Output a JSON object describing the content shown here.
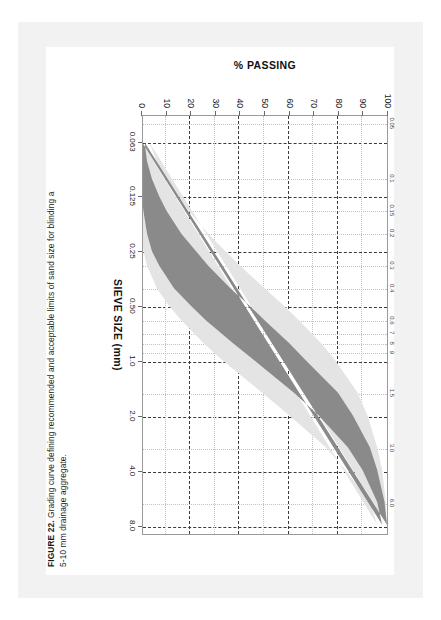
{
  "caption": {
    "figure_label": "FIGURE 22.",
    "line1": " Grading curve defining recommended and acceptable limits of sand size for blinding a",
    "line2": "5-10 mm drainage aggregate."
  },
  "colors": {
    "recommended_band": "#8a8a8a",
    "acceptable_band": "#e4e4e4",
    "grid_major": "#3a3a3a",
    "grid_minor": "#c2c2c2",
    "page_background": "#f2f2f2",
    "plot_background": "#ffffff",
    "frame": "#9a9a9a"
  },
  "chart_data": {
    "type": "area",
    "title": "",
    "xlabel": "SIEVE SIZE (mm)",
    "ylabel": "% PASSING",
    "xscale": "log",
    "xlim": [
      0.045,
      9.0
    ],
    "ylim": [
      0,
      100
    ],
    "grid": true,
    "legend": "none",
    "x_major_ticks": [
      "0.063",
      "0.125",
      "0.25",
      "0.50",
      "1.0",
      "2.0",
      "4.0",
      "8.0"
    ],
    "x_major_values": [
      0.063,
      0.125,
      0.25,
      0.5,
      1.0,
      2.0,
      4.0,
      8.0
    ],
    "x_secondary_ticks": [
      "0.05",
      "0.1",
      "0.15",
      "0.2",
      "0.3",
      "0.4",
      "0.6",
      "7",
      "8",
      "9",
      "1.5",
      "3.0",
      "6.0"
    ],
    "x_secondary_values": [
      0.05,
      0.1,
      0.15,
      0.2,
      0.3,
      0.4,
      0.6,
      0.7,
      0.8,
      0.9,
      1.5,
      3.0,
      6.0
    ],
    "y_ticks": [
      "0",
      "10",
      "20",
      "30",
      "40",
      "50",
      "60",
      "70",
      "80",
      "90",
      "100"
    ],
    "y_values": [
      0,
      10,
      20,
      30,
      40,
      50,
      60,
      70,
      80,
      90,
      100
    ],
    "series": [
      {
        "name": "Acceptable limits (upper bound)",
        "x": [
          0.063,
          0.08,
          0.1,
          0.125,
          0.15,
          0.2,
          0.25,
          0.3,
          0.4,
          0.5,
          0.6,
          0.8,
          1.0,
          1.5,
          2.0,
          3.0,
          4.0,
          6.0,
          8.0
        ],
        "values": [
          3,
          6,
          10,
          15,
          19,
          27,
          34,
          40,
          50,
          58,
          64,
          73,
          79,
          88,
          92,
          96,
          98,
          99.5,
          100
        ]
      },
      {
        "name": "Recommended limits (upper bound)",
        "x": [
          0.063,
          0.08,
          0.1,
          0.125,
          0.15,
          0.2,
          0.25,
          0.3,
          0.4,
          0.5,
          0.6,
          0.8,
          1.0,
          1.5,
          2.0,
          3.0,
          4.0,
          6.0,
          8.0
        ],
        "values": [
          1,
          2,
          4,
          7,
          10,
          16,
          22,
          27,
          36,
          44,
          50,
          60,
          67,
          80,
          86,
          93,
          96,
          99,
          100
        ]
      },
      {
        "name": "Recommended limits (lower bound)",
        "x": [
          0.063,
          0.08,
          0.1,
          0.125,
          0.15,
          0.2,
          0.25,
          0.3,
          0.4,
          0.5,
          0.6,
          0.8,
          1.0,
          1.5,
          2.0,
          3.0,
          4.0,
          6.0,
          8.0
        ],
        "values": [
          0,
          0,
          0,
          0,
          0.5,
          2,
          4,
          7,
          13,
          20,
          26,
          37,
          46,
          62,
          72,
          84,
          90,
          96,
          98
        ]
      },
      {
        "name": "Acceptable limits (lower bound)",
        "x": [
          0.063,
          0.08,
          0.1,
          0.125,
          0.15,
          0.2,
          0.25,
          0.3,
          0.4,
          0.5,
          0.6,
          0.8,
          1.0,
          1.5,
          2.0,
          3.0,
          4.0,
          6.0,
          8.0
        ],
        "values": [
          0,
          0,
          0,
          0,
          0,
          0,
          0.5,
          2,
          6,
          11,
          16,
          25,
          33,
          49,
          60,
          75,
          83,
          93,
          96
        ]
      }
    ],
    "annotations": []
  }
}
